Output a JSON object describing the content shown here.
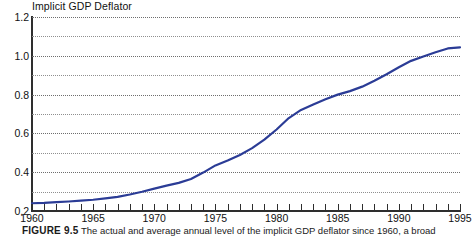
{
  "chart_data": {
    "type": "line",
    "title": "Implicit GDP Deflator",
    "xlabel": "",
    "ylabel": "",
    "xlim": [
      1960,
      1995
    ],
    "ylim": [
      0.2,
      1.2
    ],
    "grid": true,
    "legend": false,
    "line_color": "#2b3c96",
    "x_tick_labels": [
      "1960",
      "1965",
      "1970",
      "1975",
      "1980",
      "1985",
      "1990",
      "1995"
    ],
    "x_tick_values": [
      1960,
      1965,
      1970,
      1975,
      1980,
      1985,
      1990,
      1995
    ],
    "y_tick_labels": [
      "0.2",
      "0.4",
      "0.6",
      "0.8",
      "1.0",
      "1.2"
    ],
    "y_tick_values": [
      0.2,
      0.4,
      0.6,
      0.8,
      1.0,
      1.2
    ],
    "y_minor_gridlines": [
      0.3,
      0.5,
      0.7,
      0.9,
      1.1
    ],
    "series": [
      {
        "name": "Implicit GDP Deflator",
        "x": [
          1960,
          1961,
          1962,
          1963,
          1964,
          1965,
          1966,
          1967,
          1968,
          1969,
          1970,
          1971,
          1972,
          1973,
          1974,
          1975,
          1976,
          1977,
          1978,
          1979,
          1980,
          1981,
          1982,
          1983,
          1984,
          1985,
          1986,
          1987,
          1988,
          1989,
          1990,
          1991,
          1992,
          1993,
          1994,
          1995
        ],
        "values": [
          0.24,
          0.242,
          0.246,
          0.249,
          0.253,
          0.258,
          0.265,
          0.273,
          0.285,
          0.299,
          0.315,
          0.331,
          0.345,
          0.365,
          0.398,
          0.435,
          0.46,
          0.489,
          0.524,
          0.568,
          0.62,
          0.679,
          0.721,
          0.749,
          0.776,
          0.8,
          0.818,
          0.841,
          0.871,
          0.905,
          0.941,
          0.974,
          0.996,
          1.018,
          1.038,
          1.043
        ]
      }
    ]
  },
  "caption": {
    "label": "FIGURE 9.5",
    "text": "The actual and average annual level of the implicit GDP deflator since 1960, a broad"
  }
}
